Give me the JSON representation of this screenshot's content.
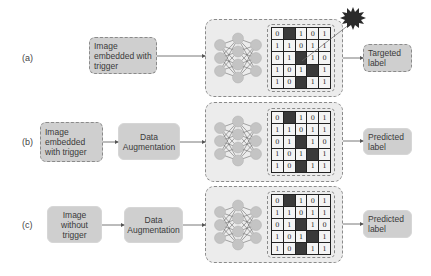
{
  "colors": {
    "box_fill": "#cfcfcf",
    "container_fill": "#ececec",
    "node_fill": "#c4c4c4",
    "dark_cell": "#3a3a3a",
    "line": "#555555"
  },
  "rows": [
    {
      "label": "(a)",
      "input": {
        "text": "Image\nembedded with\ntrigger",
        "border": "dashed"
      },
      "augmentation": null,
      "output": {
        "text": "Targeted\nlabel",
        "border": "dashed"
      },
      "trigger_burst": true
    },
    {
      "label": "(b)",
      "input": {
        "text": "Image\nembedded\nwith trigger",
        "border": "dashed"
      },
      "augmentation": {
        "text": "Data\nAugmentation"
      },
      "output": {
        "text": "Predicted\nlabel",
        "border": "solid"
      },
      "trigger_burst": false
    },
    {
      "label": "(c)",
      "input": {
        "text": "Image\nwithout\ntrigger",
        "border": "solid"
      },
      "augmentation": {
        "text": "Data\nAugmentation"
      },
      "output": {
        "text": "Predicted\nlabel",
        "border": "solid"
      },
      "trigger_burst": false
    }
  ],
  "neural_network": {
    "layers": [
      3,
      4,
      3
    ]
  },
  "matrix": {
    "values": [
      [
        "0",
        "0",
        "1",
        "0",
        "1"
      ],
      [
        "1",
        "1",
        "0",
        "1",
        "1"
      ],
      [
        "0",
        "1",
        "0",
        "1",
        "0"
      ],
      [
        "1",
        "0",
        "1",
        "1",
        "1"
      ],
      [
        "1",
        "0",
        "0",
        "1",
        "1"
      ]
    ],
    "dark_cells": [
      [
        0,
        1
      ],
      [
        2,
        2
      ],
      [
        3,
        3
      ],
      [
        4,
        2
      ]
    ]
  }
}
